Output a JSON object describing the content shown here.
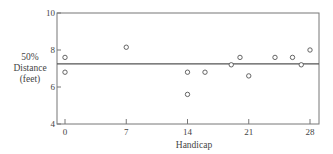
{
  "chart_data": {
    "type": "scatter",
    "title": "",
    "xlabel": "Handicap",
    "ylabel": [
      "50%",
      "Distance",
      "(feet)"
    ],
    "xlim": [
      -1,
      29
    ],
    "ylim": [
      4,
      10
    ],
    "xticks": [
      0,
      7,
      14,
      21,
      28
    ],
    "yticks": [
      4,
      6,
      8,
      10
    ],
    "grid": false,
    "reference_line": {
      "y": 7.25
    },
    "points": [
      {
        "x": 0,
        "y": 7.6
      },
      {
        "x": 0,
        "y": 6.8
      },
      {
        "x": 7,
        "y": 8.15
      },
      {
        "x": 14,
        "y": 6.8
      },
      {
        "x": 14,
        "y": 5.6
      },
      {
        "x": 16,
        "y": 6.8
      },
      {
        "x": 19,
        "y": 7.2
      },
      {
        "x": 20,
        "y": 7.6
      },
      {
        "x": 21,
        "y": 6.6
      },
      {
        "x": 24,
        "y": 7.6
      },
      {
        "x": 26,
        "y": 7.6
      },
      {
        "x": 27,
        "y": 7.2
      },
      {
        "x": 28,
        "y": 8.0
      }
    ]
  }
}
